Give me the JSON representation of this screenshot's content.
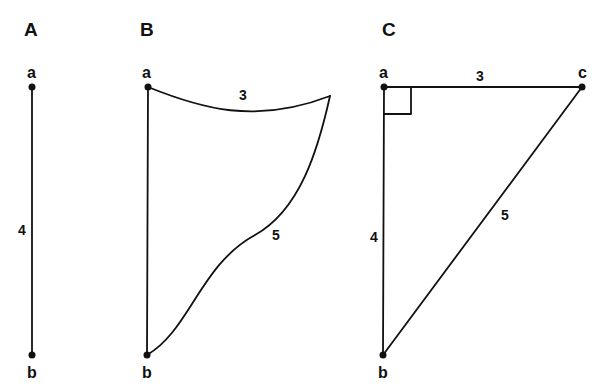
{
  "panels": [
    {
      "id": "A",
      "title": "A",
      "vertices": {
        "top": "a",
        "bottom": "b"
      },
      "edges": [
        {
          "from": "a",
          "to": "b",
          "length": "4",
          "shape": "straight"
        }
      ]
    },
    {
      "id": "B",
      "title": "B",
      "vertices": {
        "top": "a",
        "bottom": "b"
      },
      "edges": [
        {
          "from": "a",
          "to": "b",
          "length": "",
          "shape": "straight"
        },
        {
          "from": "a",
          "to": "corner",
          "length": "3",
          "shape": "curved"
        },
        {
          "from": "corner",
          "to": "b",
          "length": "5",
          "shape": "curved"
        }
      ]
    },
    {
      "id": "C",
      "title": "C",
      "vertices": {
        "top_left": "a",
        "bottom": "b",
        "top_right": "c"
      },
      "edges": [
        {
          "from": "a",
          "to": "c",
          "length": "3",
          "shape": "straight"
        },
        {
          "from": "a",
          "to": "b",
          "length": "4",
          "shape": "straight"
        },
        {
          "from": "b",
          "to": "c",
          "length": "5",
          "shape": "straight"
        }
      ],
      "right_angle_at": "a"
    }
  ],
  "colors": {
    "ink": "#111111",
    "background": "#ffffff"
  }
}
